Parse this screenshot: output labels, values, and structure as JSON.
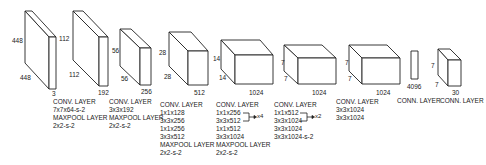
{
  "layers": [
    {
      "id": "input",
      "dims": {
        "height": "448",
        "width": "448",
        "depth": "3"
      },
      "description": []
    },
    {
      "id": "conv1",
      "dims": {
        "height": "112",
        "width": "112",
        "depth": "192"
      },
      "description": [
        "CONV. LAYER",
        "7x7x64-s-2",
        "MAXPOOL LAYER",
        "2x2-s-2"
      ]
    },
    {
      "id": "conv2",
      "dims": {
        "height": "56",
        "width": "56",
        "depth": "256"
      },
      "description": [
        "CONV. LAYER",
        "3x3x192",
        "MAXPOOL LAYER",
        "2x2-s-2"
      ]
    },
    {
      "id": "conv3",
      "dims": {
        "height": "28",
        "width": "28",
        "depth": "512"
      },
      "description": [
        "CONV. LAYER",
        "1x1x128",
        "3x3x256",
        "1x1x256",
        "3x3x512",
        "MAXPOOL LAYER",
        "2x2-s-2"
      ]
    },
    {
      "id": "conv4",
      "dims": {
        "height": "14",
        "width": "14",
        "depth": "1024"
      },
      "description": [
        "CONV. LAYER",
        "1x1x256",
        "3x3x512",
        "1x1x512",
        "3x3x1024",
        "MAXPOOL LAYER",
        "2x2-s-2"
      ],
      "repeat": "x4"
    },
    {
      "id": "conv5",
      "dims": {
        "height": "7",
        "width": "7",
        "depth": "1024"
      },
      "description": [
        "CONV. LAYER",
        "1x1x512",
        "3x3x1024",
        "3x3x1024",
        "3x3x1024-s-2"
      ],
      "repeat": "x2"
    },
    {
      "id": "conv6",
      "dims": {
        "height": "7",
        "width": "7",
        "depth": "1024"
      },
      "description": [
        "CONV. LAYER",
        "3x3x1024",
        "3x3x1024"
      ]
    },
    {
      "id": "fc1",
      "dims": {
        "depth": "4096"
      },
      "description": [
        "CONN. LAYER"
      ]
    },
    {
      "id": "fc2",
      "dims": {
        "height": "7",
        "width": "7",
        "depth": "30"
      },
      "description": [
        "CONN. LAYER"
      ]
    }
  ]
}
